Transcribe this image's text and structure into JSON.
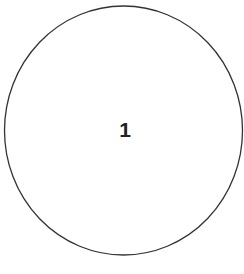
{
  "diagram": {
    "shape": "circle",
    "label": "1",
    "stroke_color": "#333333",
    "fill_color": "#ffffff"
  }
}
